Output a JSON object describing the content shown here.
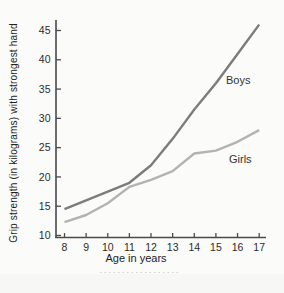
{
  "chart_data": {
    "type": "line",
    "title": "",
    "xlabel": "Age in years",
    "ylabel": "Grip strength (in kilograms) with strongest hand",
    "x": [
      8,
      9,
      10,
      11,
      12,
      13,
      14,
      15,
      16,
      17
    ],
    "xlim": [
      7.6,
      17.4
    ],
    "ylim": [
      10,
      47
    ],
    "yticks": [
      10,
      15,
      20,
      25,
      30,
      35,
      40,
      45
    ],
    "grid": false,
    "legend_position": "inline-annotations",
    "series": [
      {
        "name": "Boys",
        "values": [
          14.5,
          16,
          17.5,
          19,
          22,
          26.5,
          31.5,
          36,
          41,
          46
        ],
        "color": "#7c7c7c"
      },
      {
        "name": "Girls",
        "values": [
          12.3,
          13.5,
          15.5,
          18.3,
          19.5,
          21,
          24,
          24.5,
          26,
          28
        ],
        "color": "#b3b3b3"
      }
    ]
  },
  "colors": {
    "background": "#fbfbfa",
    "axis": "#4a4a4a",
    "tick_label": "#2b2b2b",
    "boys_line": "#7c7c7c",
    "girls_line": "#b3b3b3",
    "series_label": "#333333",
    "scan_band": "#f4f4f1",
    "scan_dots": "#c9c9c5"
  }
}
